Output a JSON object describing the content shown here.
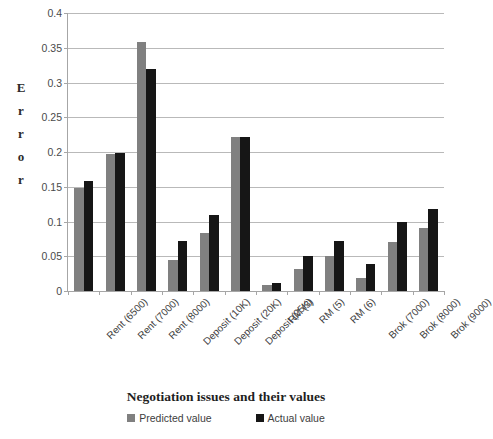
{
  "chart_data": {
    "type": "bar",
    "title": "",
    "xlabel": "Negotiation issues and their values",
    "ylabel": "Error",
    "ylim": [
      0,
      0.4
    ],
    "grid": true,
    "legend_position": "bottom",
    "categories": [
      "Rent (6500)",
      "Rent (7000)",
      "Rent (8000)",
      "Deposit (10K)",
      "Deposit (20K)",
      "Deposit (25K)",
      "RM (3)",
      "RM (5)",
      "RM (6)",
      "Brok (7000)",
      "Brok (8000)",
      "Brok (9000)"
    ],
    "ytick_labels": [
      "0.4",
      "0.35",
      "0.3",
      "0.25",
      "0.2",
      "0.15",
      "0.1",
      "0.05",
      "0"
    ],
    "ytick_values": [
      0.4,
      0.35,
      0.3,
      0.25,
      0.2,
      0.15,
      0.1,
      0.05,
      0
    ],
    "series": [
      {
        "name": "Predicted value",
        "color": "#808080",
        "values": [
          0.148,
          0.197,
          0.358,
          0.044,
          0.083,
          0.222,
          0.008,
          0.032,
          0.05,
          0.019,
          0.07,
          0.09
        ]
      },
      {
        "name": "Actual value",
        "color": "#161616",
        "values": [
          0.158,
          0.199,
          0.319,
          0.072,
          0.11,
          0.222,
          0.011,
          0.05,
          0.072,
          0.039,
          0.1,
          0.118
        ]
      }
    ]
  },
  "axis": {
    "y_title_letters": [
      "E",
      "r",
      "r",
      "o",
      "r"
    ]
  }
}
